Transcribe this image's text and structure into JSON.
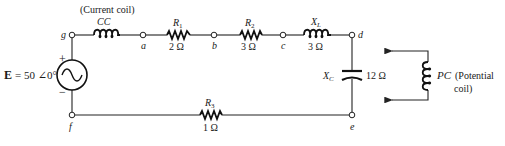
{
  "source": {
    "label_bold": "E",
    "label_value": "= 50 ∠0°",
    "plus": "+",
    "minus": "−"
  },
  "nodes": {
    "g": "g",
    "a": "a",
    "b": "b",
    "c": "c",
    "d": "d",
    "e": "e",
    "f": "f"
  },
  "components": {
    "current_coil": {
      "caption": "(Current coil)",
      "name": "CC"
    },
    "r1": {
      "name": "R",
      "sub": "1",
      "value": "2 Ω"
    },
    "r2": {
      "name": "R",
      "sub": "2",
      "value": "3 Ω"
    },
    "xl": {
      "name": "X",
      "sub": "L",
      "value": "3 Ω"
    },
    "xc": {
      "name": "X",
      "sub": "C",
      "value": "12 Ω"
    },
    "r3": {
      "name": "R",
      "sub": "3",
      "value": "1 Ω"
    },
    "potential_coil": {
      "name": "PC",
      "caption_line1": "(Potential",
      "caption_line2": "coil)"
    }
  }
}
